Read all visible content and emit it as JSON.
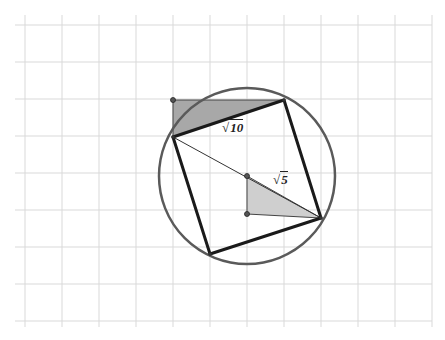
{
  "diagram": {
    "title": "",
    "grid": {
      "x0": 25,
      "y0": 25,
      "step": 37,
      "cols": 11,
      "rows": 8,
      "x_end": 432,
      "y_end": 327,
      "color": "#d9d9d9"
    },
    "circle": {
      "cx": 247,
      "cy": 176,
      "r": 88,
      "color": "#5a5a5a"
    },
    "square": {
      "vertices": [
        [
          173,
          137
        ],
        [
          284,
          100
        ],
        [
          321,
          218
        ],
        [
          210,
          254
        ]
      ],
      "color": "#1a1a1a"
    },
    "diagonal": {
      "from": [
        173,
        137
      ],
      "to": [
        321,
        218
      ],
      "color": "#333333"
    },
    "triangles": [
      {
        "name": "side-triangle",
        "points": [
          [
            173,
            100
          ],
          [
            284,
            100
          ],
          [
            173,
            137
          ]
        ],
        "fill": "#a8a8a8"
      },
      {
        "name": "radius-triangle",
        "points": [
          [
            247,
            176
          ],
          [
            247,
            214
          ],
          [
            321,
            218
          ]
        ],
        "fill": "#cfcfcf"
      }
    ],
    "points": [
      [
        173,
        100
      ],
      [
        247,
        176
      ],
      [
        247,
        214
      ]
    ],
    "labels": [
      {
        "name": "side-length-label",
        "radicand": "10",
        "x": 222,
        "y": 120
      },
      {
        "name": "radius-length-label",
        "radicand": "5",
        "x": 273,
        "y": 172
      }
    ]
  }
}
